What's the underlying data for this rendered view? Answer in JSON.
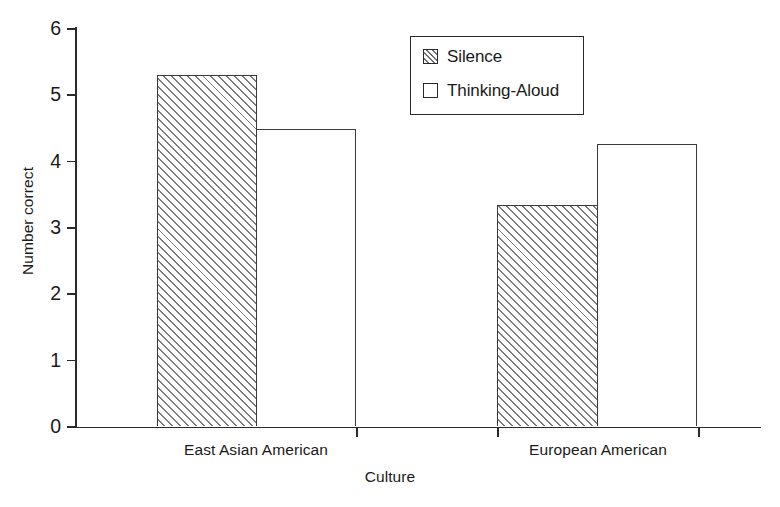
{
  "chart_data": {
    "type": "bar",
    "title": "",
    "xlabel": "Culture",
    "ylabel": "Number correct",
    "categories": [
      "East Asian American",
      "European American"
    ],
    "series": [
      {
        "name": "Silence",
        "values": [
          5.29,
          3.33
        ],
        "fill": "hatched"
      },
      {
        "name": "Thinking-Aloud",
        "values": [
          4.48,
          4.25
        ],
        "fill": "white"
      }
    ],
    "ylim": [
      0,
      6
    ],
    "ytick_labels": [
      "0",
      "1",
      "2",
      "3",
      "4",
      "5",
      "6"
    ],
    "ytick_values": [
      0,
      1,
      2,
      3,
      4,
      5,
      6
    ],
    "grid": false,
    "legend_position": "top-center",
    "legend_entries": [
      "Silence",
      "Thinking-Aloud"
    ],
    "colors": {
      "axis": "#2a2a2a",
      "bar_outline": "#3a3a3a",
      "bar_fill": "#ffffff",
      "hatch": "#7d7d7d",
      "text": "#1a1a1a",
      "background": "#ffffff"
    }
  }
}
